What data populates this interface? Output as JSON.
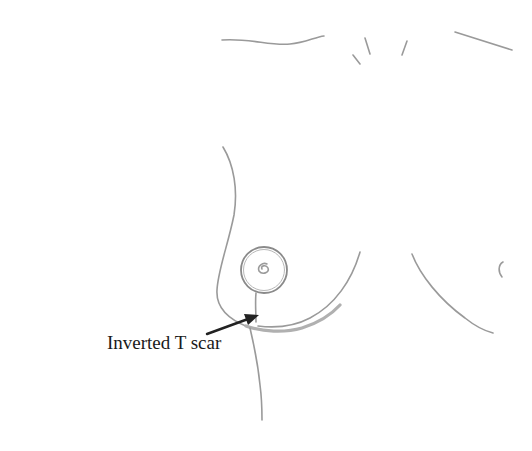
{
  "diagram": {
    "type": "medical-line-drawing",
    "annotation": {
      "label": "Inverted T scar",
      "arrow_color": "#222222"
    },
    "colors": {
      "background": "#ffffff",
      "pencil_line": "#9a9a9a",
      "scar_line": "#b0b0b0",
      "label_text": "#1a1a1a"
    }
  }
}
